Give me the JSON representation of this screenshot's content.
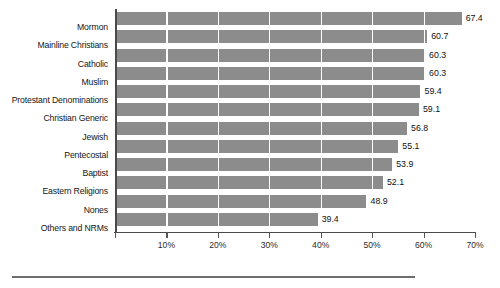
{
  "chart_data": {
    "type": "bar",
    "orientation": "horizontal",
    "title": "",
    "subtitle": "",
    "xlabel": "",
    "ylabel": "",
    "xlim": [
      0,
      70
    ],
    "grid": true,
    "grid_axis": "x",
    "legend": "none",
    "bar_color": "#8c8c8c",
    "axis_color": "#4a4a4a",
    "categories": [
      "Mormon",
      "Mainline Christians",
      "Catholic",
      "Muslim",
      "Protestant Denominations",
      "Christian Generic",
      "Jewish",
      "Pentecostal",
      "Baptist",
      "Eastern Religions",
      "Nones",
      "Others and NRMs"
    ],
    "values": [
      67.4,
      60.7,
      60.3,
      60.3,
      59.4,
      59.1,
      56.8,
      55.1,
      53.9,
      52.1,
      48.9,
      39.4
    ],
    "value_labels": [
      "67.4",
      "60.7",
      "60.3",
      "60.3",
      "59.4",
      "59.1",
      "56.8",
      "55.1",
      "53.9",
      "52.1",
      "48.9",
      "39.4"
    ],
    "xticks": [
      0,
      10,
      20,
      30,
      40,
      50,
      60,
      70
    ],
    "xtick_labels": [
      "",
      "10%",
      "20%",
      "30%",
      "40%",
      "50%",
      "60%",
      "70%"
    ]
  }
}
